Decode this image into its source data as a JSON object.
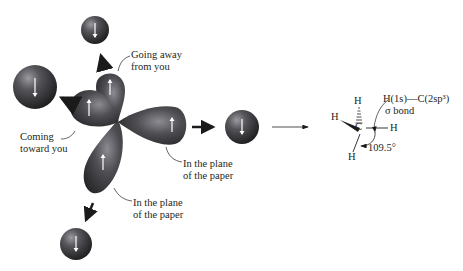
{
  "labels": {
    "going_away": [
      "Going away",
      "from you"
    ],
    "coming_toward": [
      "Coming",
      "toward you"
    ],
    "plane_right": [
      "In the plane",
      "of the paper"
    ],
    "plane_bottom": [
      "In the plane",
      "of the paper"
    ]
  },
  "molecule": {
    "atom_center": "C",
    "atom_h_top": "H",
    "atom_h_left": "H",
    "atom_h_right": "H",
    "atom_h_bottom": "H",
    "bond_label_line1": "H(1s)—C(2sp³)",
    "bond_label_line2": "σ bond",
    "angle": "109.5°"
  },
  "colors": {
    "orbital_dark": "#2a2a2c",
    "orbital_mid": "#5a5a5e",
    "orbital_light": "#8a8a90",
    "arrow": "#1a1a1a",
    "spin_arrow": "#ffffff"
  }
}
